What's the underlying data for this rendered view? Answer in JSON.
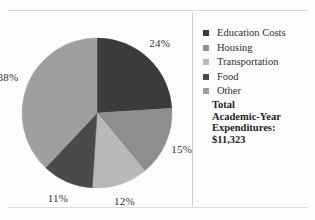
{
  "figure": {
    "background": "#fdfdfd",
    "divider_color": "#cfcfcf"
  },
  "chart_data": {
    "type": "pie",
    "title": "",
    "categories": [
      "Education Costs",
      "Housing",
      "Transportation",
      "Food",
      "Other"
    ],
    "values": [
      24,
      15,
      12,
      11,
      38
    ],
    "value_labels": [
      "24%",
      "15%",
      "12%",
      "11%",
      "38%"
    ],
    "unit": "percent",
    "start_angle_deg": 0,
    "direction": "clockwise",
    "colors": [
      "#3b3b3b",
      "#8e8e8e",
      "#b8b8b8",
      "#4a4a4a",
      "#9f9f9f"
    ],
    "legend_position": "right",
    "grid": false,
    "annotations": [
      "Total",
      "Academic-Year",
      "Expenditures:",
      "$11,323"
    ]
  },
  "legend": {
    "items": [
      {
        "label": "Education Costs",
        "color": "#3b3b3b",
        "value_label": "24%"
      },
      {
        "label": "Housing",
        "color": "#8e8e8e",
        "value_label": "15%"
      },
      {
        "label": "Transportation",
        "color": "#b8b8b8",
        "value_label": "12%"
      },
      {
        "label": "Food",
        "color": "#4a4a4a",
        "value_label": "11%"
      },
      {
        "label": "Other",
        "color": "#9f9f9f",
        "value_label": "38%"
      }
    ]
  },
  "summary": {
    "line1": "Total",
    "line2": "Academic-Year",
    "line3": "Expenditures:",
    "line4": "$11,323"
  }
}
